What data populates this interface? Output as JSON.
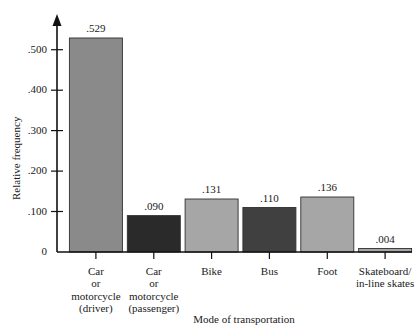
{
  "chart_data": {
    "type": "bar",
    "title": "",
    "xlabel": "Mode of transportation",
    "ylabel": "Relative frequency",
    "categories": [
      "Car or motorcycle (driver)",
      "Car or motorcycle (passenger)",
      "Bike",
      "Bus",
      "Foot",
      "Skateboard/ in-line skates"
    ],
    "category_lines": [
      [
        "Car",
        "or",
        "motorcycle",
        "(driver)"
      ],
      [
        "Car",
        "or",
        "motorcycle",
        "(passenger)"
      ],
      [
        "Bike"
      ],
      [
        "Bus"
      ],
      [
        "Foot"
      ],
      [
        "Skateboard/",
        "in-line skates"
      ]
    ],
    "values": [
      0.529,
      0.09,
      0.131,
      0.11,
      0.136,
      0.004
    ],
    "value_labels": [
      ".529",
      ".090",
      ".131",
      ".110",
      ".136",
      ".004"
    ],
    "bar_colors": [
      "#8a8a8a",
      "#2a2a2a",
      "#a6a6a6",
      "#404040",
      "#a6a6a6",
      "#a6a6a6"
    ],
    "ylim": [
      0,
      0.56
    ],
    "yticks": [
      0,
      0.1,
      0.2,
      0.3,
      0.4,
      0.5
    ],
    "ytick_labels": [
      "0",
      ".100",
      ".200",
      ".300",
      ".400",
      ".500"
    ],
    "grid": false,
    "legend": "none",
    "axis_color": "#111111",
    "background": "#ffffff"
  }
}
